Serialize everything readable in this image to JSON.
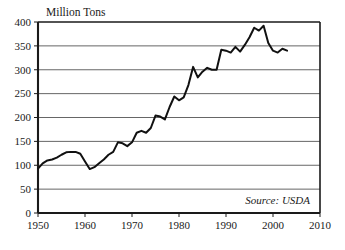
{
  "chart_data": {
    "type": "line",
    "title": "",
    "xlabel": "",
    "ylabel": "Million Tons",
    "ylabel_position": "top-left-above-axis",
    "xlim": [
      1950,
      2010
    ],
    "ylim": [
      0,
      400
    ],
    "xticks": [
      1950,
      1960,
      1970,
      1980,
      1990,
      2000,
      2010
    ],
    "yticks": [
      0,
      50,
      100,
      150,
      200,
      250,
      300,
      350,
      400
    ],
    "xtick_labels": [
      "1950",
      "1960",
      "1970",
      "1980",
      "1990",
      "2000",
      "2010"
    ],
    "ytick_labels": [
      "0",
      "50",
      "100",
      "150",
      "200",
      "250",
      "300",
      "350",
      "400"
    ],
    "grid": "horizontal",
    "legend": "none",
    "annotations": [
      {
        "text": "Source: USDA",
        "style": "italic",
        "position": "bottom-right-inside-plot"
      }
    ],
    "series": [
      {
        "name": "Production",
        "color": "#111111",
        "line_width": 2,
        "x": [
          1950,
          1951,
          1952,
          1953,
          1954,
          1955,
          1956,
          1957,
          1958,
          1959,
          1960,
          1961,
          1962,
          1963,
          1964,
          1965,
          1966,
          1967,
          1968,
          1969,
          1970,
          1971,
          1972,
          1973,
          1974,
          1975,
          1976,
          1977,
          1978,
          1979,
          1980,
          1981,
          1982,
          1983,
          1984,
          1985,
          1986,
          1987,
          1988,
          1989,
          1990,
          1991,
          1992,
          1993,
          1994,
          1995,
          1996,
          1997,
          1998,
          1999,
          2000,
          2001,
          2002,
          2003
        ],
        "values": [
          93,
          104,
          110,
          112,
          116,
          122,
          127,
          128,
          128,
          124,
          108,
          92,
          96,
          104,
          112,
          122,
          128,
          148,
          146,
          140,
          148,
          168,
          172,
          168,
          178,
          204,
          202,
          196,
          222,
          244,
          236,
          242,
          268,
          306,
          284,
          296,
          304,
          300,
          300,
          342,
          340,
          336,
          348,
          338,
          352,
          368,
          388,
          382,
          392,
          356,
          340,
          336,
          344,
          340
        ]
      }
    ]
  }
}
